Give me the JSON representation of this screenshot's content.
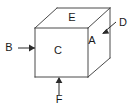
{
  "figure": {
    "kind": "cube-projection-diagram",
    "background_color": "#ffffff",
    "line_color": "#4a4a4a",
    "arrow_color": "#2b2b2b",
    "label_color": "#1a1a1a"
  },
  "face_labels": {
    "top": "E",
    "front": "C",
    "right": "A"
  },
  "arrow_labels": {
    "left": "B",
    "upper_right": "D",
    "bottom": "F"
  },
  "geometry": {
    "front_face": "35,28 88,28 88,77 35,77",
    "top_face": "35,28 57,8 110,8 88,28",
    "right_face": "88,28 110,8 110,58 88,77",
    "edges": {
      "front_top": "M35,28 L88,28",
      "front_right": "M88,28 L88,77",
      "front_bottom": "M35,77 L88,77",
      "front_left": "M35,28 L35,77",
      "top_left_diag": "M35,28 L57,8",
      "top_back": "M57,8 L110,8",
      "top_right_diag": "M88,28 L110,8",
      "back_right_vertical": "M110,8 L110,58",
      "bottom_right_diag": "M88,77 L110,58"
    },
    "leaders": {
      "b_line": "M18,48 L35,48",
      "d_line": "M116,22 L103,33",
      "f_line": "M59,95 L59,78"
    },
    "arrowheads": {
      "b_head": "35,48 29,44.6 29,51.4",
      "d_head": "102,34 106.6,28.8 109.2,33.6",
      "f_head": "59,77 55.6,83 62.4,83"
    },
    "label_positions": {
      "E": {
        "x": 72,
        "y": 18
      },
      "A": {
        "x": 92,
        "y": 41
      },
      "C": {
        "x": 58,
        "y": 51
      },
      "B": {
        "x": 9,
        "y": 48
      },
      "D": {
        "x": 123,
        "y": 23
      },
      "F": {
        "x": 59,
        "y": 100
      }
    }
  }
}
